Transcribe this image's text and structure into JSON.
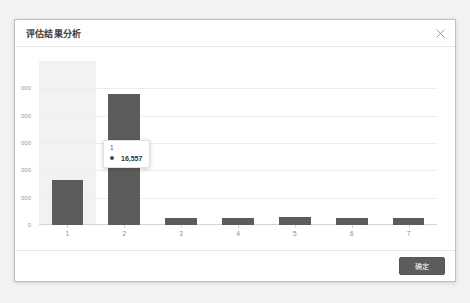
{
  "dialog": {
    "title": "评估结果分析",
    "close_icon": "close-icon"
  },
  "footer": {
    "confirm_label": "确定"
  },
  "tooltip": {
    "title": "1",
    "value": "16,557",
    "marker_color": "#4a4a4a"
  },
  "colors": {
    "bar": "#5c5c5c",
    "gridline": "#ededed",
    "hover_band": "#f2f2f2",
    "axis": "#d4d4d4",
    "button": "#5c5c5c",
    "dialog_border": "#bfbfbf",
    "backdrop": "#f2f2f2",
    "tick_text": "#9a9a9a"
  },
  "chart_data": {
    "type": "bar",
    "title": "",
    "xlabel": "",
    "ylabel": "",
    "categories": [
      "1",
      "2",
      "3",
      "4",
      "5",
      "6",
      "7"
    ],
    "values": [
      16557,
      48000,
      2400,
      2600,
      3100,
      2600,
      2500
    ],
    "series": [
      {
        "name": "1",
        "values": [
          16557,
          48000,
          2400,
          2600,
          3100,
          2600,
          2500
        ]
      }
    ],
    "ylim": [
      0,
      60000
    ],
    "ytick_labels": [
      "0",
      "000",
      "000",
      "000",
      "000",
      "000"
    ],
    "ytick_values": [
      0,
      10000,
      20000,
      30000,
      40000,
      50000
    ],
    "ytick_labels_clipped": true,
    "grid": true,
    "legend": false,
    "hovered_category": "1",
    "hover_highlight": true
  }
}
